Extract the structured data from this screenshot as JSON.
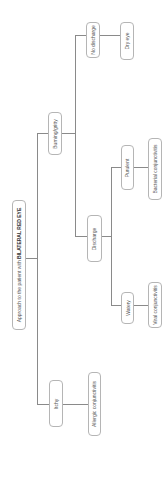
{
  "diagram": {
    "title_prefix": "Approach to the patient with ",
    "title_emphasis": "BILATERAL RED EYE",
    "nodes": {
      "root": "Approach to the patient with BILATERAL RED EYE",
      "burning": "Burning/gritty",
      "no_discharge": "No discharge",
      "dry_eye": "Dry eye",
      "discharge": "Discharge",
      "purulent": "Purulent",
      "bacterial": "Bacterial conjunctivitis",
      "watery": "Watery",
      "viral": "Viral conjunctivitis",
      "itchy": "Itchy",
      "allergic": "Allergic conjunctivitis"
    },
    "edges": [
      [
        "root",
        "burning"
      ],
      [
        "root",
        "itchy"
      ],
      [
        "burning",
        "no_discharge"
      ],
      [
        "burning",
        "discharge"
      ],
      [
        "no_discharge",
        "dry_eye"
      ],
      [
        "discharge",
        "purulent"
      ],
      [
        "discharge",
        "watery"
      ],
      [
        "purulent",
        "bacterial"
      ],
      [
        "watery",
        "viral"
      ],
      [
        "itchy",
        "allergic"
      ]
    ],
    "colors": {
      "line": "#8a8a8a",
      "border": "#b5b5b5",
      "text": "#555555"
    }
  }
}
